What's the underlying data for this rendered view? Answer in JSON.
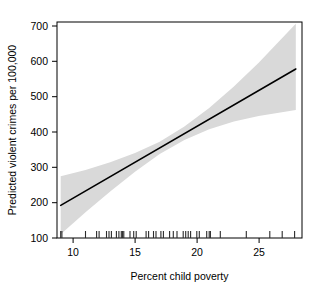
{
  "chart_data": {
    "type": "line",
    "title": "",
    "xlabel": "Percent child poverty",
    "ylabel": "Predicted violent crimes per 100,000",
    "xlim": [
      8.7,
      28.5
    ],
    "ylim": [
      85,
      715
    ],
    "xticks": [
      10,
      15,
      20,
      25
    ],
    "xticklabels": [
      "10",
      "15",
      "20",
      "25"
    ],
    "yticks": [
      100,
      200,
      300,
      400,
      500,
      600,
      700
    ],
    "yticklabels": [
      "100",
      "200",
      "300",
      "400",
      "500",
      "600",
      "700"
    ],
    "grid": false,
    "legend": "none",
    "series": [
      {
        "name": "Predicted violent crime rate",
        "type": "line",
        "color": "#000000",
        "x": [
          9.0,
          11.0,
          13.0,
          15.0,
          17.0,
          19.0,
          21.0,
          23.0,
          25.0,
          28.0
        ],
        "values": [
          180,
          222,
          264,
          306,
          348,
          390,
          432,
          474,
          516,
          578
        ]
      },
      {
        "name": "95% confidence band upper",
        "type": "area",
        "color": "#d9d9d9",
        "x": [
          9.0,
          11.0,
          13.0,
          15.0,
          17.0,
          19.0,
          21.0,
          23.0,
          25.0,
          28.0
        ],
        "values": [
          265,
          283,
          306,
          333,
          366,
          410,
          464,
          527,
          596,
          710
        ]
      },
      {
        "name": "95% confidence band lower",
        "type": "area",
        "color": "#d9d9d9",
        "x": [
          9.0,
          11.0,
          13.0,
          15.0,
          17.0,
          19.0,
          21.0,
          23.0,
          25.0,
          28.0
        ],
        "values": [
          96,
          160,
          221,
          278,
          330,
          371,
          402,
          425,
          441,
          458
        ]
      }
    ],
    "rug": {
      "name": "observed percent child poverty values",
      "values": [
        9.0,
        9.1,
        11.0,
        11.9,
        12.1,
        12.7,
        12.9,
        13.1,
        13.5,
        13.7,
        13.9,
        14.0,
        14.1,
        14.6,
        14.9,
        15.1,
        15.9,
        16.1,
        16.5,
        16.7,
        17.1,
        17.3,
        17.8,
        18.1,
        18.4,
        18.9,
        19.1,
        19.3,
        19.5,
        20.0,
        20.2,
        20.8,
        21.0,
        21.1,
        21.9,
        24.0,
        25.9,
        26.9,
        27.9
      ]
    }
  },
  "geometry": {
    "plot_left": 57,
    "plot_right": 302,
    "plot_top": 22,
    "plot_bottom": 238
  }
}
